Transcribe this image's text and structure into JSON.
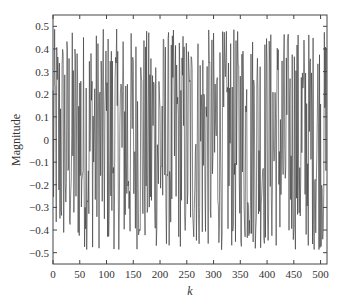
{
  "chart_data": {
    "type": "line",
    "title": "",
    "xlabel": "k",
    "ylabel": "Magnitude",
    "xlim": [
      0,
      512
    ],
    "ylim": [
      -0.55,
      0.55
    ],
    "grid": false,
    "legend": null,
    "x_ticks": [
      0,
      50,
      100,
      150,
      200,
      250,
      300,
      350,
      400,
      450,
      500
    ],
    "y_ticks": [
      -0.5,
      -0.4,
      -0.3,
      -0.2,
      -0.1,
      0,
      0.1,
      0.2,
      0.3,
      0.4,
      0.5
    ],
    "x_tick_labels": [
      "0",
      "50",
      "100",
      "150",
      "200",
      "250",
      "300",
      "350",
      "400",
      "450",
      "500"
    ],
    "y_tick_labels": [
      "−0.5",
      "−0.4",
      "−0.3",
      "−0.2",
      "−0.1",
      "0",
      "0.1",
      "0.2",
      "0.3",
      "0.4",
      "0.5"
    ],
    "series": [
      {
        "name": "signal",
        "color": "#333333",
        "n_points": 512,
        "description": "Dense noise-like signal oscillating between about -0.5 and 0.5",
        "amplitude_range": [
          -0.5,
          0.5
        ]
      }
    ]
  }
}
